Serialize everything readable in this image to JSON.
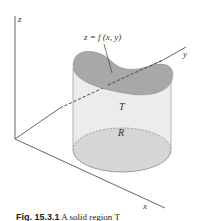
{
  "figure": {
    "axes": {
      "z_label": "z",
      "y_label": "y",
      "x_label": "x"
    },
    "surface_label": "z = f (x, y)",
    "solid_label": "T",
    "region_label": "R",
    "caption": {
      "number": "Fig. 15.3.1",
      "text": "A solid region T"
    },
    "colors": {
      "surface": "#a8a8a8",
      "sides": "#ececec",
      "base": "#d6d6d6",
      "axis": "#555555"
    }
  }
}
